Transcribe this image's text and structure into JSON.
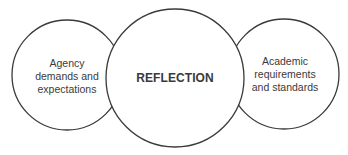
{
  "diagram": {
    "type": "overlapping-circles",
    "colors": {
      "stroke": "#3a3a3a",
      "fill": "#ffffff",
      "text": "#3a3a3a"
    },
    "nodes": [
      {
        "id": "left",
        "label": "Agency\ndemands and\nexpectations",
        "cx": 67,
        "cy": 75,
        "r": 55
      },
      {
        "id": "center",
        "label": "REFLECTION",
        "cx": 175,
        "cy": 78,
        "r": 69
      },
      {
        "id": "right",
        "label": "Academic\nrequirements\nand standards",
        "cx": 284,
        "cy": 74,
        "r": 55
      }
    ]
  }
}
